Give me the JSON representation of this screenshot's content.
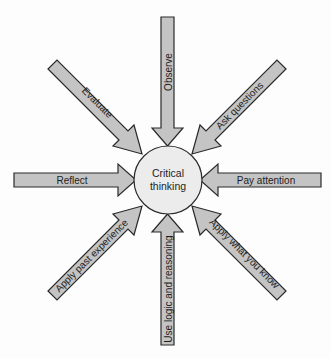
{
  "diagram": {
    "center": {
      "line1": "Critical",
      "line2": "thinking",
      "fill": "#ececec",
      "stroke": "#2a2a2a"
    },
    "arrow_fill": "#c4c4c4",
    "arrow_stroke": "#2a2a2a",
    "arrows": [
      {
        "label": "Observe",
        "direction": "from-top"
      },
      {
        "label": "Ask questions",
        "direction": "from-top-right"
      },
      {
        "label": "Pay attention",
        "direction": "from-right"
      },
      {
        "label": "Apply what you know",
        "direction": "from-bottom-right"
      },
      {
        "label": "Use logic and reasoning",
        "direction": "from-bottom"
      },
      {
        "label": "Apply past experience",
        "direction": "from-bottom-left"
      },
      {
        "label": "Reflect",
        "direction": "from-left"
      },
      {
        "label": "Evaluate",
        "direction": "from-top-left"
      }
    ]
  }
}
